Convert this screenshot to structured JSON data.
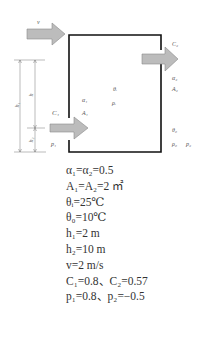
{
  "diagram": {
    "labels": {
      "v": "v",
      "C1": "C₁",
      "p1": "p₁",
      "alpha1": "α₁",
      "A1": "A₁",
      "theta_i": "θᵢ",
      "rho_i": "ρᵢ",
      "C2": "C₂",
      "alpha2": "α₂",
      "A2": "A₂",
      "theta_0": "θ₀",
      "rho_0": "ρ₀",
      "p2": "p₂",
      "h1": "h₁",
      "h": "h",
      "h2": "h₂"
    },
    "colors": {
      "wall": "#111111",
      "arrow_fill": "#b8b8b8",
      "arrow_stroke": "#888888",
      "dimension": "#666666"
    }
  },
  "formulas": [
    {
      "text": "α₁=α₂=0.5"
    },
    {
      "text": "A₁=A₂=2 ㎡"
    },
    {
      "text": "θᵢ=25℃"
    },
    {
      "text": "θ₀=10℃"
    },
    {
      "text": "h₁=2 m"
    },
    {
      "text": "h₂=10 m"
    },
    {
      "text": "v=2 m/s"
    },
    {
      "text": "C₁=0.8、C₂=0.57"
    },
    {
      "text": "p₁=0.8、p₂=−0.5"
    }
  ]
}
